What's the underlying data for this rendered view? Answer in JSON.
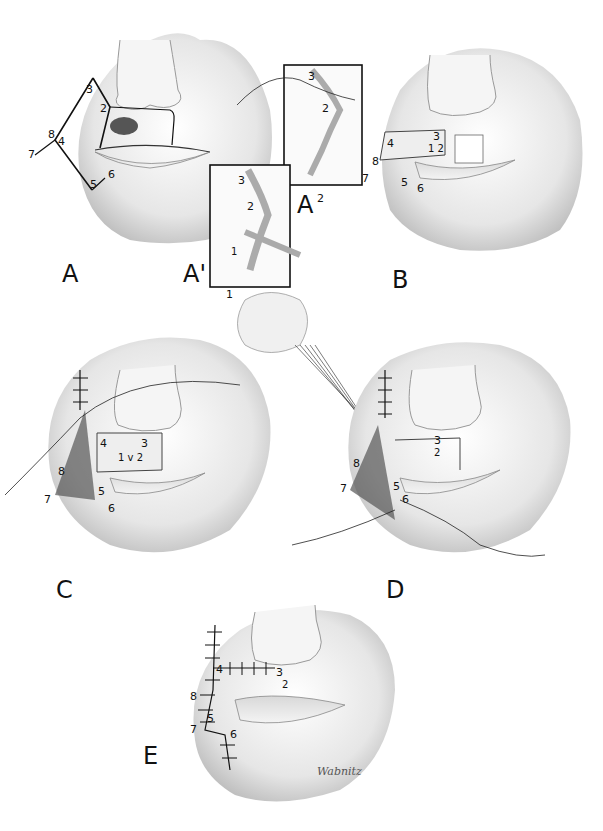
{
  "figure": {
    "panels": [
      {
        "id": "A",
        "label": "A",
        "description": "Lesion on upper lip with flap outline",
        "points": [
          "2",
          "3",
          "4",
          "5",
          "6",
          "7",
          "8"
        ]
      },
      {
        "id": "A1",
        "label": "A'",
        "sub": "1",
        "description": "Inset: incision detail",
        "points": [
          "1",
          "2",
          "3"
        ]
      },
      {
        "id": "A2",
        "label": "A",
        "sup": "2",
        "description": "Inset: suturing detail",
        "points": [
          "2",
          "3"
        ]
      },
      {
        "id": "B",
        "label": "B",
        "description": "Flap rotated, teeth exposed",
        "points": [
          "1",
          "2",
          "3",
          "4",
          "5",
          "6",
          "7",
          "8"
        ]
      },
      {
        "id": "C",
        "label": "C",
        "description": "Flap advanced with sutures",
        "points": [
          "1",
          "2",
          "3",
          "4",
          "5",
          "6",
          "7",
          "8"
        ]
      },
      {
        "id": "D",
        "label": "D",
        "description": "Traction sutures held by fingers",
        "points": [
          "2",
          "3",
          "5",
          "6",
          "7",
          "8"
        ]
      },
      {
        "id": "E",
        "label": "E",
        "description": "Final closure with sutures",
        "points": [
          "3",
          "4",
          "5",
          "6",
          "7",
          "8"
        ]
      }
    ],
    "signature": "Wabnitz",
    "colors": {
      "background": "#ffffff",
      "ink": "#111111",
      "shade": "#9a9a9a"
    }
  }
}
